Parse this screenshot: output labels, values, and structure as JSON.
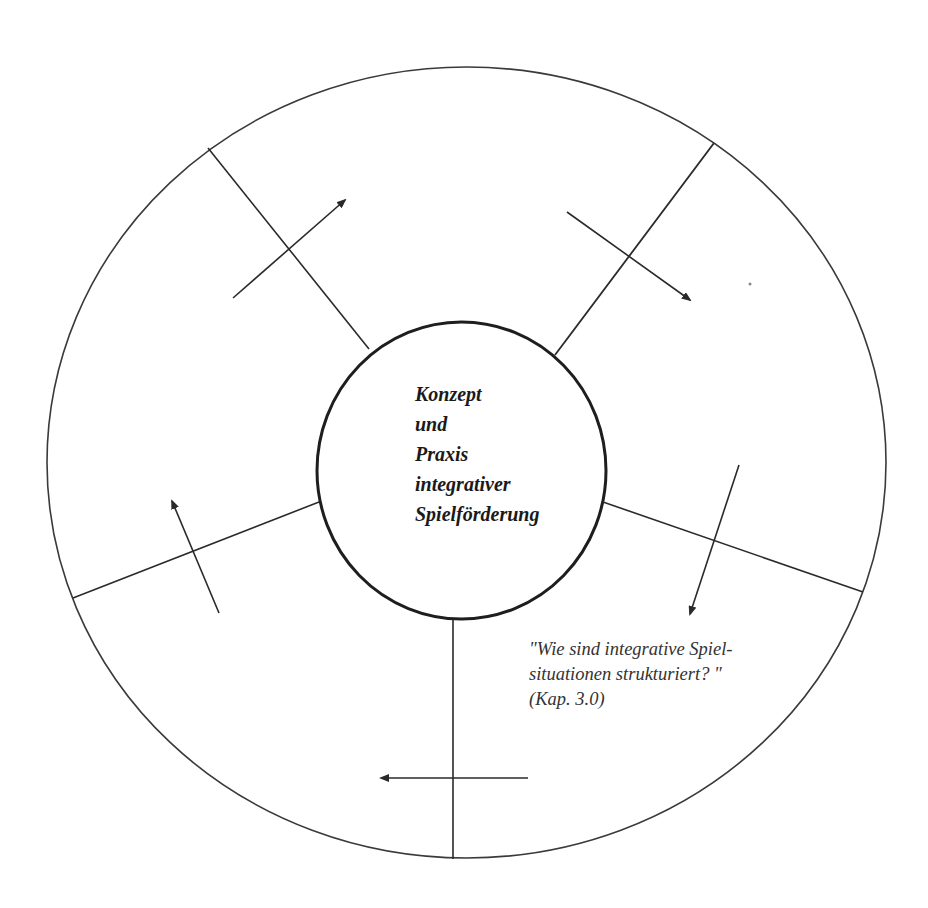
{
  "diagram": {
    "center_title_lines": [
      "Konzept",
      "und",
      "Praxis",
      "integrativer",
      "Spielförderung"
    ],
    "annotation_lines": [
      "\"Wie sind integrative Spiel-",
      "situationen strukturiert? \"",
      "(Kap. 3.0)"
    ],
    "segments": [
      {
        "name": "upper-left",
        "arrow_direction": "outward-up-right"
      },
      {
        "name": "upper-right",
        "arrow_direction": "outward-down-right"
      },
      {
        "name": "right",
        "arrow_direction": "down"
      },
      {
        "name": "bottom",
        "arrow_direction": "left"
      },
      {
        "name": "left",
        "arrow_direction": "up"
      }
    ],
    "colors": {
      "line": "#2a2a2a",
      "text": "#1a1a1a",
      "annotation": "#333333",
      "background": "#ffffff"
    }
  }
}
